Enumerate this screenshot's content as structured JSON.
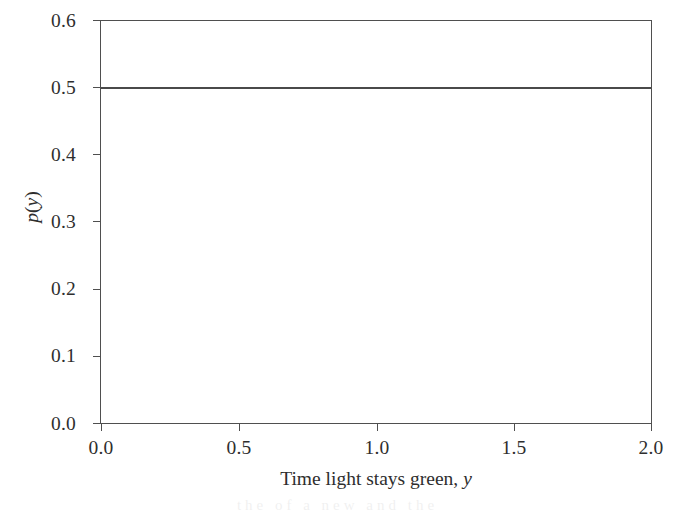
{
  "chart_data": {
    "type": "line",
    "title": "",
    "subtitle": "",
    "xlabel_prefix": "Time light stays green,",
    "xlabel_variable": "y",
    "ylabel_prefix": "p",
    "ylabel_variable": "y",
    "ylabel_open": "(",
    "ylabel_close": ")",
    "x": [
      0.0,
      2.0
    ],
    "values": [
      0.5,
      0.5
    ],
    "series": [
      {
        "name": "p(y)",
        "x": [
          0.0,
          2.0
        ],
        "values": [
          0.5,
          0.5
        ],
        "color": "#4a4a4a",
        "style": "solid"
      }
    ],
    "xlim": [
      0.0,
      2.0
    ],
    "ylim": [
      0.0,
      0.6
    ],
    "xticks": [
      0.0,
      0.5,
      1.0,
      1.5,
      2.0
    ],
    "yticks": [
      0.0,
      0.1,
      0.2,
      0.3,
      0.4,
      0.5,
      0.6
    ],
    "xticklabels": [
      "0.0",
      "0.5",
      "1.0",
      "1.5",
      "2.0"
    ],
    "yticklabels": [
      "0.0",
      "0.1",
      "0.2",
      "0.3",
      "0.4",
      "0.5",
      "0.6"
    ],
    "grid": false,
    "legend": false,
    "legend_position": "none",
    "tick_direction": "out",
    "frame": "full-box",
    "annotations": []
  },
  "style": {
    "background_color": "#ffffff",
    "axis_color": "#4f4f4f",
    "text_color": "#2e2e2e",
    "line_color": "#4a4a4a"
  },
  "scan": {
    "bleed_text": "the of a new and the"
  }
}
